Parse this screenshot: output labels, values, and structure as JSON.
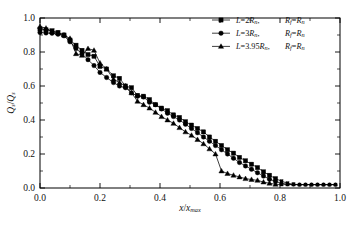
{
  "chart_data": {
    "type": "line",
    "title": "",
    "xlabel": "x/x_max",
    "ylabel": "Q_s/Q_s",
    "xlabel_parts": {
      "num": "x",
      "den": "x",
      "den_sub": "max"
    },
    "ylabel_parts": {
      "num": "Q",
      "num_sub": "s",
      "den": "Q",
      "den_sub": "s"
    },
    "xlim": [
      0.0,
      1.0
    ],
    "ylim": [
      0.0,
      1.0
    ],
    "xticks": [
      "0.0",
      "0.2",
      "0.4",
      "0.6",
      "0.8",
      "1.0"
    ],
    "yticks": [
      "0.0",
      "0.2",
      "0.4",
      "0.6",
      "0.8",
      "1.0"
    ],
    "xtick_values": [
      0.0,
      0.2,
      0.4,
      0.6,
      0.8,
      1.0
    ],
    "ytick_values": [
      0.0,
      0.2,
      0.4,
      0.6,
      0.8,
      1.0
    ],
    "minor_ticks_per_interval": 1,
    "grid": false,
    "legend_position": "upper-right",
    "legend_frame": false,
    "series": [
      {
        "name": "L=2Rn, Rf=Rn",
        "marker": "square",
        "label_parts": {
          "lhs": "L",
          "eq": "=",
          "coef": "2",
          "base": "R",
          "base_sub": "n",
          "comma": ",",
          "rhs_a": "R",
          "rhs_a_sub": "f",
          "rhs_eq": "=",
          "rhs_b": "R",
          "rhs_b_sub": "n"
        },
        "x": [
          0.0,
          0.02,
          0.04,
          0.06,
          0.08,
          0.1,
          0.12,
          0.14,
          0.16,
          0.18,
          0.2,
          0.222,
          0.245,
          0.265,
          0.285,
          0.305,
          0.325,
          0.345,
          0.365,
          0.385,
          0.405,
          0.425,
          0.445,
          0.465,
          0.485,
          0.505,
          0.525,
          0.545,
          0.565,
          0.585,
          0.605,
          0.625,
          0.645,
          0.665,
          0.685,
          0.705,
          0.725,
          0.745,
          0.765,
          0.785,
          0.805,
          0.825,
          0.845,
          0.865,
          0.885,
          0.905,
          0.925,
          0.945,
          0.965,
          0.985
        ],
        "y": [
          0.935,
          0.93,
          0.925,
          0.915,
          0.9,
          0.87,
          0.84,
          0.81,
          0.785,
          0.775,
          0.715,
          0.7,
          0.66,
          0.645,
          0.6,
          0.59,
          0.545,
          0.54,
          0.52,
          0.49,
          0.47,
          0.455,
          0.43,
          0.415,
          0.39,
          0.37,
          0.35,
          0.33,
          0.3,
          0.275,
          0.25,
          0.225,
          0.205,
          0.18,
          0.16,
          0.14,
          0.12,
          0.095,
          0.075,
          0.055,
          0.04,
          0.028,
          0.022,
          0.02,
          0.02,
          0.02,
          0.02,
          0.02,
          0.02,
          0.02
        ]
      },
      {
        "name": "L=3Rn, Rf=Rn",
        "marker": "circle",
        "label_parts": {
          "lhs": "L",
          "eq": "=",
          "coef": "3",
          "base": "R",
          "base_sub": "n",
          "comma": ",",
          "rhs_a": "R",
          "rhs_a_sub": "f",
          "rhs_eq": "=",
          "rhs_b": "R",
          "rhs_b_sub": "n"
        },
        "x": [
          0.0,
          0.02,
          0.04,
          0.06,
          0.08,
          0.1,
          0.12,
          0.14,
          0.16,
          0.18,
          0.2,
          0.222,
          0.245,
          0.265,
          0.285,
          0.305,
          0.325,
          0.345,
          0.365,
          0.385,
          0.405,
          0.425,
          0.445,
          0.465,
          0.485,
          0.505,
          0.525,
          0.545,
          0.565,
          0.585,
          0.605,
          0.625,
          0.645,
          0.665,
          0.685,
          0.705,
          0.725,
          0.745,
          0.765,
          0.785,
          0.805,
          0.825,
          0.845,
          0.865,
          0.885,
          0.905,
          0.925,
          0.945,
          0.965,
          0.985
        ],
        "y": [
          0.915,
          0.912,
          0.91,
          0.905,
          0.895,
          0.86,
          0.82,
          0.79,
          0.755,
          0.72,
          0.68,
          0.65,
          0.62,
          0.6,
          0.59,
          0.56,
          0.54,
          0.535,
          0.505,
          0.49,
          0.465,
          0.44,
          0.42,
          0.4,
          0.375,
          0.35,
          0.325,
          0.3,
          0.275,
          0.25,
          0.225,
          0.2,
          0.175,
          0.15,
          0.13,
          0.11,
          0.09,
          0.07,
          0.052,
          0.038,
          0.028,
          0.022,
          0.02,
          0.02,
          0.02,
          0.02,
          0.02,
          0.02,
          0.02,
          0.02
        ]
      },
      {
        "name": "L=3.95Rn, Rf=Rn",
        "marker": "triangle",
        "label_parts": {
          "lhs": "L",
          "eq": "=",
          "coef": "3.95",
          "base": "R",
          "base_sub": "n",
          "comma": ",",
          "rhs_a": "R",
          "rhs_a_sub": "f",
          "rhs_eq": "=",
          "rhs_b": "R",
          "rhs_b_sub": "n"
        },
        "x": [
          0.0,
          0.02,
          0.04,
          0.06,
          0.08,
          0.1,
          0.12,
          0.14,
          0.16,
          0.18,
          0.2,
          0.222,
          0.245,
          0.265,
          0.285,
          0.305,
          0.325,
          0.345,
          0.365,
          0.385,
          0.405,
          0.425,
          0.445,
          0.465,
          0.485,
          0.505,
          0.525,
          0.545,
          0.565,
          0.585,
          0.605,
          0.625,
          0.645,
          0.665,
          0.685,
          0.705,
          0.725,
          0.745,
          0.765,
          0.785,
          0.805,
          0.825,
          0.845,
          0.865,
          0.885,
          0.905,
          0.925,
          0.945,
          0.965,
          0.985
        ],
        "y": [
          0.95,
          0.94,
          0.92,
          0.912,
          0.9,
          0.88,
          0.79,
          0.78,
          0.82,
          0.81,
          0.735,
          0.7,
          0.64,
          0.62,
          0.6,
          0.56,
          0.51,
          0.49,
          0.47,
          0.445,
          0.42,
          0.4,
          0.38,
          0.355,
          0.33,
          0.31,
          0.285,
          0.26,
          0.23,
          0.2,
          0.1,
          0.085,
          0.075,
          0.065,
          0.055,
          0.05,
          0.045,
          0.035,
          0.028,
          0.022,
          0.02,
          0.02,
          0.02,
          0.02,
          0.02,
          0.02,
          0.02,
          0.02,
          0.02,
          0.02
        ]
      }
    ]
  }
}
